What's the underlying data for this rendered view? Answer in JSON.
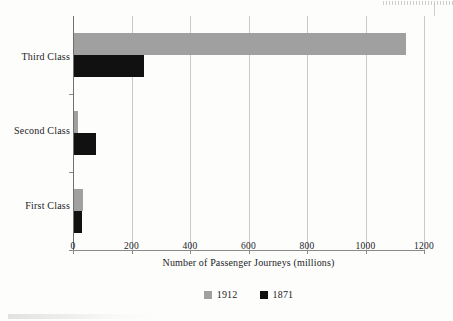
{
  "chart_data": {
    "type": "bar",
    "orientation": "horizontal",
    "title": "",
    "subtitle": "",
    "xlabel": "Number of Passenger Journeys (millions)",
    "ylabel": "",
    "categories": [
      "Third Class",
      "Second Class",
      "First Class"
    ],
    "series": [
      {
        "name": "1912",
        "color": "#a0a0a0",
        "values": [
          1135,
          15,
          30
        ]
      },
      {
        "name": "1871",
        "color": "#111111",
        "values": [
          239,
          75,
          28
        ]
      }
    ],
    "xlim": [
      0,
      1200
    ],
    "xticks": [
      0,
      200,
      400,
      600,
      800,
      1000,
      1200
    ],
    "xticklabels": [
      "0",
      "200",
      "400",
      "600",
      "800",
      "1000",
      "1200"
    ],
    "grid": "vertical",
    "legend_position": "bottom-center",
    "legend_entries": [
      "1912",
      "1871"
    ]
  },
  "colors": {
    "series_1912": "#a0a0a0",
    "series_1871": "#111111",
    "axis": "#8a8a8a",
    "gridline": "#c9c9c9",
    "text": "#1c1c1c",
    "background": "#fdfdfc"
  }
}
